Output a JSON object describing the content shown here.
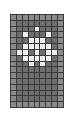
{
  "figure": {
    "background_color": "#ffffff"
  },
  "grid": {
    "columns": 9,
    "rows": 16,
    "cell_size_px": 6,
    "gridline_color": "#3a3a3a",
    "gridline_width_px": 1,
    "bounds": {
      "x": 10,
      "y": 14,
      "width": 54,
      "height": 94
    },
    "palette": {
      "dark": "#6e6e6e",
      "mid": "#8a8a8a",
      "light": "#b4b4b4",
      "bright": "#efefef"
    },
    "legend": [
      {
        "key": "dark",
        "label": "dark gray",
        "color": "#6e6e6e"
      },
      {
        "key": "mid",
        "label": "medium gray",
        "color": "#8a8a8a"
      },
      {
        "key": "light",
        "label": "light gray",
        "color": "#b4b4b4"
      },
      {
        "key": "bright",
        "label": "near white",
        "color": "#efefef"
      }
    ],
    "cells": [
      [
        "mid",
        "mid",
        "mid",
        "mid",
        "mid",
        "mid",
        "mid",
        "mid",
        "mid"
      ],
      [
        "mid",
        "dark",
        "dark",
        "dark",
        "dark",
        "dark",
        "dark",
        "dark",
        "mid"
      ],
      [
        "mid",
        "dark",
        "dark",
        "dark",
        "bright",
        "dark",
        "dark",
        "dark",
        "mid"
      ],
      [
        "mid",
        "dark",
        "bright",
        "dark",
        "dark",
        "dark",
        "bright",
        "dark",
        "mid"
      ],
      [
        "mid",
        "dark",
        "dark",
        "bright",
        "bright",
        "bright",
        "dark",
        "dark",
        "mid"
      ],
      [
        "mid",
        "dark",
        "bright",
        "bright",
        "bright",
        "bright",
        "bright",
        "dark",
        "mid"
      ],
      [
        "mid",
        "bright",
        "bright",
        "dark",
        "bright",
        "dark",
        "bright",
        "bright",
        "mid"
      ],
      [
        "mid",
        "dark",
        "bright",
        "bright",
        "bright",
        "bright",
        "bright",
        "dark",
        "mid"
      ],
      [
        "mid",
        "dark",
        "dark",
        "bright",
        "dark",
        "bright",
        "dark",
        "dark",
        "mid"
      ],
      [
        "mid",
        "dark",
        "dark",
        "dark",
        "dark",
        "dark",
        "dark",
        "dark",
        "mid"
      ],
      [
        "mid",
        "dark",
        "dark",
        "dark",
        "dark",
        "dark",
        "dark",
        "dark",
        "mid"
      ],
      [
        "mid",
        "dark",
        "dark",
        "dark",
        "dark",
        "dark",
        "dark",
        "dark",
        "mid"
      ],
      [
        "mid",
        "dark",
        "dark",
        "dark",
        "dark",
        "dark",
        "dark",
        "dark",
        "mid"
      ],
      [
        "mid",
        "dark",
        "dark",
        "dark",
        "dark",
        "dark",
        "dark",
        "dark",
        "mid"
      ],
      [
        "mid",
        "dark",
        "dark",
        "dark",
        "dark",
        "dark",
        "dark",
        "dark",
        "mid"
      ],
      [
        "mid",
        "mid",
        "mid",
        "mid",
        "mid",
        "mid",
        "mid",
        "mid",
        "mid"
      ]
    ]
  }
}
